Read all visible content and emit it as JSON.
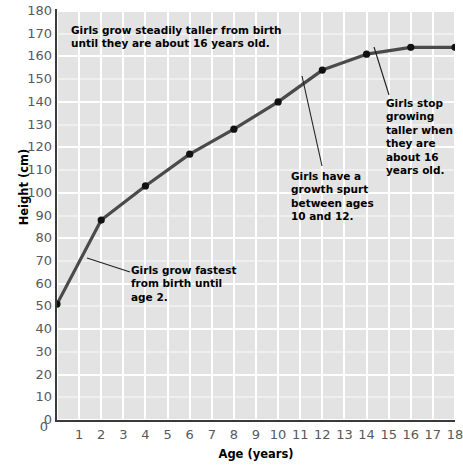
{
  "chart_data": {
    "type": "line",
    "title": "",
    "xlabel": "Age (years)",
    "ylabel": "Height (cm)",
    "xlim": [
      0,
      18
    ],
    "ylim": [
      0,
      180
    ],
    "grid": true,
    "legend": "none",
    "x": [
      0,
      2,
      4,
      6,
      8,
      10,
      12,
      14,
      16,
      18
    ],
    "values": [
      51,
      88,
      103,
      117,
      128,
      140,
      154,
      161,
      164,
      164
    ],
    "series": [
      {
        "name": "Girls average height",
        "x": [
          0,
          2,
          4,
          6,
          8,
          10,
          12,
          14,
          16,
          18
        ],
        "values": [
          51,
          88,
          103,
          117,
          128,
          140,
          154,
          161,
          164,
          164
        ]
      }
    ],
    "x_ticks": [
      "0",
      "1",
      "2",
      "3",
      "4",
      "5",
      "6",
      "7",
      "8",
      "9",
      "10",
      "11",
      "12",
      "13",
      "14",
      "15",
      "16",
      "17",
      "18"
    ],
    "y_ticks": [
      "0",
      "10",
      "20",
      "30",
      "40",
      "50",
      "60",
      "70",
      "80",
      "90",
      "100",
      "110",
      "120",
      "130",
      "140",
      "150",
      "160",
      "170",
      "180"
    ],
    "annotations": [
      {
        "id": "steady",
        "text": "Girls grow steadily taller from birth\nuntil they are about 16 years old.",
        "points_to": "overall trend"
      },
      {
        "id": "stop",
        "text": "Girls stop\ngrowing\ntaller when\nthey are\nabout 16\nyears old.",
        "points_to": "age 16"
      },
      {
        "id": "spurt",
        "text": "Girls have a\ngrowth spurt\nbetween ages\n10 and 12.",
        "points_to": "ages 10 to 12"
      },
      {
        "id": "fastest",
        "text": "Girls grow fastest\nfrom birth until\nage 2.",
        "points_to": "ages 0 to 2"
      }
    ],
    "colors": {
      "plot_background": "#e3e3e3",
      "gridline": "#ffffff",
      "line": "#4a4a4a",
      "marker": "#111111",
      "axis": "#3a3a3a",
      "tick_label": "#58595b",
      "annotation_text": "#000000"
    }
  }
}
